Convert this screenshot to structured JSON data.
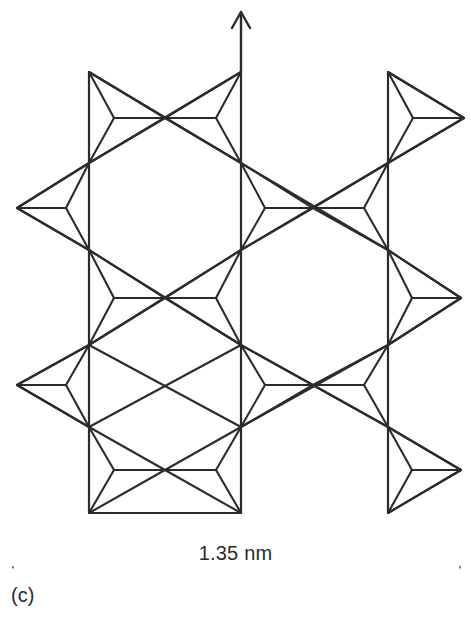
{
  "figure": {
    "panel_label": "(c)",
    "dimension": {
      "value": "1.35 nm",
      "axis": "horizontal",
      "start_x": 13,
      "end_x": 460,
      "y": 557
    },
    "orientation_arrow": {
      "name": "c-axis-arrow",
      "direction": "up",
      "x": 241,
      "from_y": 72,
      "to_y": 12
    },
    "stroke_color": "#2b2b2b",
    "background_color": "#ffffff",
    "line_width": 2.1
  },
  "structure": {
    "description": "Projected tetrahedral framework (zeolite-type) of corner-sharing triangular TO4 units forming hexagonal pores",
    "vertical_columns_x": [
      89,
      241,
      388
    ],
    "node_rows_y": [
      72,
      163,
      208,
      250,
      298,
      345,
      385,
      427,
      470,
      513
    ],
    "hexagon_half_width": 76,
    "spike_apex_left_x": 17,
    "spike_apex_right_x": 461,
    "triangles": [
      {
        "name": "tri-top-left-right",
        "a": [
          89,
          72
        ],
        "b": [
          89,
          163
        ],
        "c": [
          165,
          118
        ],
        "center": [
          114,
          118
        ]
      },
      {
        "name": "tri-top-center-left",
        "a": [
          241,
          72
        ],
        "b": [
          241,
          163
        ],
        "c": [
          165,
          118
        ],
        "center": [
          216,
          118
        ]
      },
      {
        "name": "tri-top-right-right",
        "a": [
          388,
          72
        ],
        "b": [
          388,
          163
        ],
        "c": [
          464,
          118
        ],
        "center": [
          413,
          118
        ]
      },
      {
        "name": "tri-mid1-left-spike",
        "a": [
          89,
          163
        ],
        "b": [
          89,
          250
        ],
        "c": [
          17,
          208
        ],
        "center": [
          66,
          208
        ]
      },
      {
        "name": "tri-mid1-center-left",
        "a": [
          241,
          163
        ],
        "b": [
          241,
          250
        ],
        "c": [
          313,
          208
        ],
        "center": [
          265,
          208
        ]
      },
      {
        "name": "tri-mid1-center-right",
        "a": [
          388,
          163
        ],
        "b": [
          388,
          250
        ],
        "c": [
          313,
          208
        ],
        "center": [
          364,
          208
        ]
      },
      {
        "name": "tri-mid2-left",
        "a": [
          89,
          250
        ],
        "b": [
          89,
          345
        ],
        "c": [
          165,
          298
        ],
        "center": [
          114,
          298
        ]
      },
      {
        "name": "tri-mid2-center",
        "a": [
          241,
          250
        ],
        "b": [
          241,
          345
        ],
        "c": [
          165,
          298
        ],
        "center": [
          216,
          298
        ]
      },
      {
        "name": "tri-mid2-right-spike",
        "a": [
          388,
          250
        ],
        "b": [
          388,
          345
        ],
        "c": [
          461,
          298
        ],
        "center": [
          412,
          298
        ]
      },
      {
        "name": "tri-mid3-left-spike",
        "a": [
          89,
          345
        ],
        "b": [
          89,
          427
        ],
        "c": [
          17,
          385
        ],
        "center": [
          66,
          385
        ]
      },
      {
        "name": "tri-mid3-center-left",
        "a": [
          241,
          345
        ],
        "b": [
          241,
          427
        ],
        "c": [
          313,
          385
        ],
        "center": [
          265,
          385
        ]
      },
      {
        "name": "tri-mid3-center-right",
        "a": [
          388,
          345
        ],
        "b": [
          388,
          427
        ],
        "c": [
          313,
          385
        ],
        "center": [
          364,
          385
        ]
      },
      {
        "name": "tri-bot-left",
        "a": [
          89,
          427
        ],
        "b": [
          89,
          513
        ],
        "c": [
          165,
          470
        ],
        "center": [
          114,
          470
        ]
      },
      {
        "name": "tri-bot-center",
        "a": [
          241,
          427
        ],
        "b": [
          241,
          513
        ],
        "c": [
          165,
          470
        ],
        "center": [
          216,
          470
        ]
      },
      {
        "name": "tri-bot-right-spike",
        "a": [
          388,
          427
        ],
        "b": [
          388,
          513
        ],
        "c": [
          461,
          470
        ],
        "center": [
          412,
          470
        ]
      }
    ],
    "long_edges": [
      {
        "name": "edge-col-left",
        "x1": 89,
        "y1": 72,
        "x2": 89,
        "y2": 513
      },
      {
        "name": "edge-col-center",
        "x1": 241,
        "y1": 72,
        "x2": 241,
        "y2": 513
      },
      {
        "name": "edge-col-right",
        "x1": 388,
        "y1": 72,
        "x2": 388,
        "y2": 513
      },
      {
        "name": "edge-hex1-tl",
        "x1": 89,
        "y1": 163,
        "x2": 241,
        "y2": 72
      },
      {
        "name": "edge-hex1-tr",
        "x1": 241,
        "y1": 163,
        "x2": 89,
        "y2": 72
      },
      {
        "name": "edge-hex1-bl",
        "x1": 89,
        "y1": 250,
        "x2": 241,
        "y2": 345
      },
      {
        "name": "edge-hex1-br",
        "x1": 241,
        "y1": 250,
        "x2": 89,
        "y2": 345
      },
      {
        "name": "edge-hex2-tl",
        "x1": 241,
        "y1": 250,
        "x2": 388,
        "y2": 163
      },
      {
        "name": "edge-hex2-tr",
        "x1": 388,
        "y1": 250,
        "x2": 241,
        "y2": 163
      },
      {
        "name": "edge-hex2-bl",
        "x1": 241,
        "y1": 427,
        "x2": 388,
        "y2": 345
      },
      {
        "name": "edge-hex2-br",
        "x1": 388,
        "y1": 427,
        "x2": 241,
        "y2": 345
      },
      {
        "name": "edge-hex3-tl",
        "x1": 89,
        "y1": 427,
        "x2": 241,
        "y2": 345
      },
      {
        "name": "edge-hex3-tr",
        "x1": 241,
        "y1": 427,
        "x2": 89,
        "y2": 345
      },
      {
        "name": "edge-hex3-bl",
        "x1": 89,
        "y1": 513,
        "x2": 241,
        "y2": 513
      },
      {
        "name": "edge-spike-l1-t",
        "x1": 89,
        "y1": 163,
        "x2": 17,
        "y2": 208
      },
      {
        "name": "edge-spike-l1-b",
        "x1": 89,
        "y1": 250,
        "x2": 17,
        "y2": 208
      },
      {
        "name": "edge-spike-l2-t",
        "x1": 89,
        "y1": 345,
        "x2": 17,
        "y2": 385
      },
      {
        "name": "edge-spike-l2-b",
        "x1": 89,
        "y1": 427,
        "x2": 17,
        "y2": 385
      },
      {
        "name": "edge-spike-r1-t",
        "x1": 388,
        "y1": 72,
        "x2": 464,
        "y2": 118
      },
      {
        "name": "edge-spike-r1-b",
        "x1": 388,
        "y1": 163,
        "x2": 464,
        "y2": 118
      },
      {
        "name": "edge-spike-r2-t",
        "x1": 388,
        "y1": 250,
        "x2": 461,
        "y2": 298
      },
      {
        "name": "edge-spike-r2-b",
        "x1": 388,
        "y1": 345,
        "x2": 461,
        "y2": 298
      },
      {
        "name": "edge-spike-r3-t",
        "x1": 388,
        "y1": 427,
        "x2": 461,
        "y2": 470
      },
      {
        "name": "edge-spike-r3-b",
        "x1": 388,
        "y1": 513,
        "x2": 461,
        "y2": 470
      }
    ]
  }
}
